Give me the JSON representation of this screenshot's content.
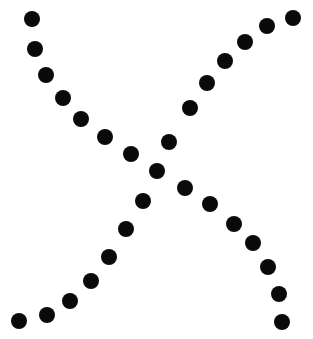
{
  "image": {
    "title": "Dotted X symbol",
    "description": "Two crossing dotted diagonal strokes forming a large letter X drawn with solid black circular dots on a white background",
    "width": 313,
    "height": 339,
    "background_color": "#ffffff",
    "foreground_color": "#000000",
    "dot_shape": "circle",
    "dot_diameter": 16,
    "dot_count_total": 29
  },
  "chart_data": {
    "type": "scatter",
    "subtitle": "",
    "xlabel": "",
    "ylabel": "",
    "xlim": [
      0,
      313
    ],
    "ylim": [
      0,
      339
    ],
    "grid": false,
    "legend": "none",
    "marker": "circle",
    "marker_size": 16,
    "marker_color": "#0a0a0a",
    "series": [
      {
        "name": "stroke-top-left-to-bottom-right",
        "color": "#0a0a0a",
        "points": [
          [
            32,
            19
          ],
          [
            35,
            49
          ],
          [
            46,
            75
          ],
          [
            63,
            98
          ],
          [
            81,
            119
          ],
          [
            105,
            137
          ],
          [
            131,
            154
          ],
          [
            157,
            171
          ],
          [
            185,
            188
          ],
          [
            210,
            204
          ],
          [
            234,
            224
          ],
          [
            253,
            243
          ],
          [
            268,
            267
          ],
          [
            279,
            294
          ],
          [
            282,
            322
          ]
        ]
      },
      {
        "name": "stroke-bottom-left-to-top-right",
        "color": "#0a0a0a",
        "points": [
          [
            19,
            321
          ],
          [
            47,
            315
          ],
          [
            70,
            301
          ],
          [
            91,
            281
          ],
          [
            109,
            257
          ],
          [
            126,
            229
          ],
          [
            143,
            201
          ],
          [
            169,
            142
          ],
          [
            190,
            108
          ],
          [
            207,
            83
          ],
          [
            225,
            61
          ],
          [
            245,
            42
          ],
          [
            267,
            26
          ],
          [
            293,
            18
          ]
        ]
      }
    ]
  }
}
